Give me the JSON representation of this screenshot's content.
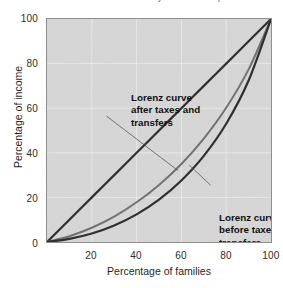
{
  "caption": {
    "text": "the share of income received by the lowest quintile of families"
  },
  "chart_data": {
    "type": "line",
    "title": "",
    "subtitle": "",
    "xlabel": "Percentage of families",
    "ylabel": "Percentage of income",
    "xlim": [
      0,
      100
    ],
    "ylim": [
      0,
      100
    ],
    "xticks": [
      "20",
      "40",
      "60",
      "80",
      "100"
    ],
    "xtick_values": [
      20,
      40,
      60,
      80,
      100
    ],
    "yticks": [
      "0",
      "20",
      "40",
      "60",
      "80",
      "100"
    ],
    "ytick_values": [
      0,
      20,
      40,
      60,
      80,
      100
    ],
    "grid": true,
    "grid_color": "#ffffff",
    "legend_position": "none",
    "plot_background": "#d7d7d7",
    "x": [
      0,
      10,
      20,
      30,
      40,
      50,
      60,
      70,
      80,
      90,
      100
    ],
    "series": [
      {
        "name": "Line of equality",
        "color": "#2a2a2a",
        "width": 2.2,
        "values": [
          0,
          10,
          20,
          30,
          40,
          50,
          60,
          70,
          80,
          90,
          100
        ]
      },
      {
        "name": "Lorenz curve after taxes and transfers",
        "color": "#6f6f6f",
        "width": 2.0,
        "values": [
          0,
          2.6,
          6.4,
          11.4,
          17.8,
          25.6,
          35.0,
          46.4,
          60.2,
          77.4,
          100
        ]
      },
      {
        "name": "Lorenz curve before taxes and transfers",
        "color": "#2a2a2a",
        "width": 2.2,
        "values": [
          0,
          1.4,
          3.8,
          7.4,
          12.4,
          19.0,
          27.6,
          38.6,
          53.0,
          72.4,
          100
        ]
      }
    ],
    "annotations": [
      {
        "id": "after",
        "text": "Lorenz curve\nafter taxes and\ntransfers",
        "leader_from": [
          26.5,
          56.5
        ],
        "leader_to": [
          58.5,
          32.0
        ]
      },
      {
        "id": "before",
        "text": "Lorenz curve\nbefore taxes and\ntransfers",
        "leader_from": [
          73.0,
          25.5
        ],
        "leader_to": [
          63.5,
          34.5
        ]
      }
    ]
  }
}
